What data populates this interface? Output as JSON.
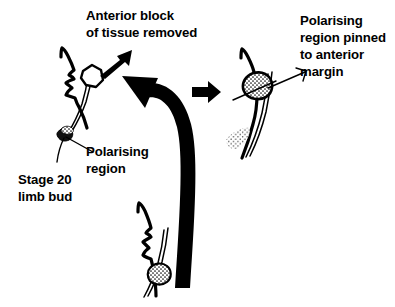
{
  "figure": {
    "title_absent": true,
    "background_color": "#ffffff",
    "ink_color": "#000000"
  },
  "labels": {
    "anterior_block": {
      "line1": "Anterior block",
      "line2": "of tissue removed"
    },
    "polarising_region": {
      "line1": "Polarising",
      "line2": "region"
    },
    "stage_20_limb_bud": {
      "line1": "Stage 20",
      "line2": "limb bud"
    },
    "pinned": {
      "line1": "Polarising",
      "line2": "region pinned",
      "line3": "to anterior",
      "line4": "margin"
    }
  },
  "panels": {
    "left": {
      "name": "host-limb-bud-with-anterior-block-removed",
      "features": [
        "limb-bud-outline",
        "anterior-notch",
        "excised-block",
        "polarising-region-blob"
      ]
    },
    "bottom": {
      "name": "donor-limb-bud-with-polarising-region",
      "features": [
        "limb-bud-outline",
        "polarising-region-stippled-blob"
      ]
    },
    "right": {
      "name": "operated-limb-bud-graft-in-place",
      "features": [
        "limb-bud-outline",
        "grafted-polarising-region",
        "host-polarising-region-stippled"
      ]
    }
  },
  "arrows": {
    "removal_arrow": "points from excised block up-right to caption",
    "graft_arrow": "thick curved arrow from donor bud up to host anterior margin",
    "result_arrow": "straight right-pointing arrow to operated bud"
  }
}
